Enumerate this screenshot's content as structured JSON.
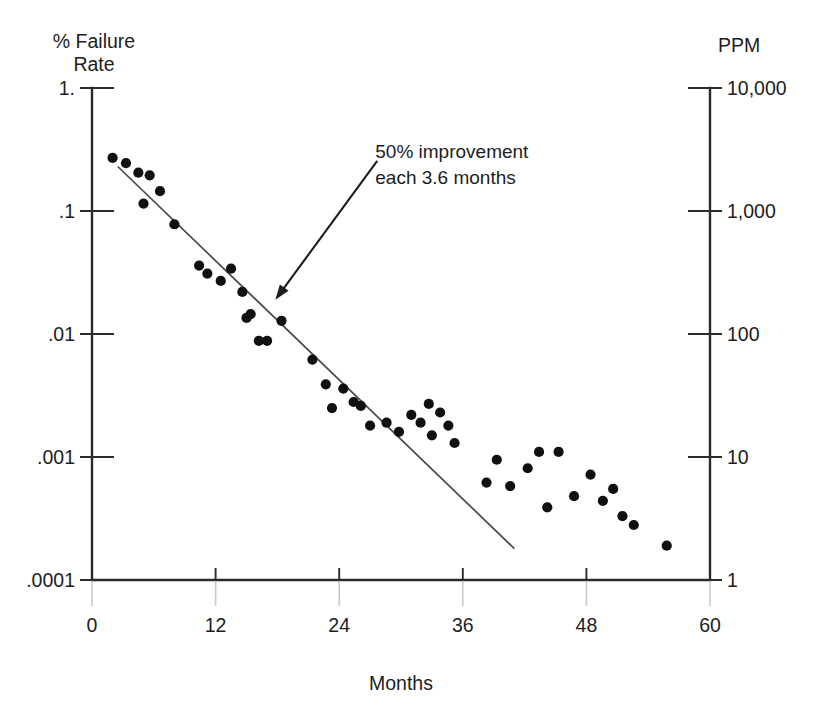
{
  "figure": {
    "left_axis_header_line1": "% Failure",
    "left_axis_header_line2": "Rate",
    "right_axis_header": "PPM",
    "xlabel": "Months",
    "annotation_line1": "50% improvement",
    "annotation_line2": "each 3.6 months",
    "caption": ""
  },
  "chart_data": {
    "type": "scatter",
    "title": "",
    "xlabel": "Months",
    "ylabel": "% Failure Rate",
    "ylabel_secondary": "PPM",
    "xlim": [
      0,
      60
    ],
    "ylim": [
      0.0001,
      1.0
    ],
    "yscale": "log",
    "grid": false,
    "legend": null,
    "xticks": [
      0,
      12,
      24,
      36,
      48,
      60
    ],
    "xticklabels": [
      "0",
      "12",
      "24",
      "36",
      "48",
      "60"
    ],
    "yticks": [
      1.0,
      0.1,
      0.01,
      0.001,
      0.0001
    ],
    "yticklabels": [
      "1.",
      ".1",
      ".01",
      ".001",
      ".0001"
    ],
    "yticks_secondary": [
      10000,
      1000,
      100,
      10,
      1
    ],
    "yticklabels_secondary": [
      "10,000",
      "1,000",
      "100",
      "10",
      "1"
    ],
    "annotations": [
      {
        "text": "50% improvement each 3.6 months",
        "text_xy": [
          27.5,
          0.27
        ],
        "arrow_tip_xy": [
          17.8,
          0.019
        ]
      }
    ],
    "series": [
      {
        "name": "Trend line",
        "type": "line",
        "note": "50% improvement each 3.6 months",
        "points": [
          [
            2.5,
            0.23
          ],
          [
            41.0,
            0.00018
          ]
        ]
      },
      {
        "name": "Observed failure rate",
        "type": "scatter",
        "x": [
          2.0,
          3.3,
          4.5,
          5.0,
          5.6,
          6.6,
          8.0,
          10.4,
          11.2,
          12.5,
          13.5,
          14.6,
          15.0,
          15.4,
          16.2,
          17.0,
          18.4,
          21.4,
          22.7,
          23.3,
          24.4,
          25.4,
          26.1,
          27.0,
          28.6,
          29.8,
          31.0,
          31.9,
          32.7,
          33.0,
          33.8,
          34.6,
          35.2,
          38.3,
          39.3,
          40.6,
          42.3,
          43.4,
          44.2,
          45.3,
          46.8,
          48.4,
          49.6,
          50.6,
          51.5,
          52.6,
          55.8
        ],
        "y": [
          0.27,
          0.245,
          0.205,
          0.115,
          0.195,
          0.145,
          0.078,
          0.036,
          0.031,
          0.027,
          0.034,
          0.022,
          0.0135,
          0.0145,
          0.0088,
          0.0088,
          0.0128,
          0.0062,
          0.0039,
          0.0025,
          0.0036,
          0.0028,
          0.0026,
          0.0018,
          0.0019,
          0.0016,
          0.0022,
          0.0019,
          0.0027,
          0.0015,
          0.0023,
          0.0018,
          0.0013,
          0.00062,
          0.00095,
          0.00058,
          0.00081,
          0.0011,
          0.00039,
          0.0011,
          0.00048,
          0.00072,
          0.00044,
          0.00055,
          0.00033,
          0.00028,
          0.00019
        ]
      }
    ]
  }
}
